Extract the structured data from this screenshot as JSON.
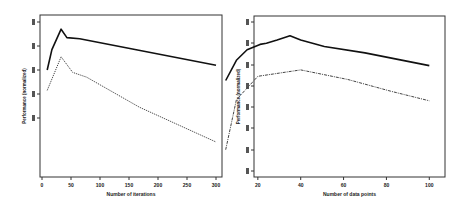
{
  "chart_data": [
    {
      "type": "line",
      "title": "",
      "xlabel": "Number of iterations",
      "ylabel": "Performance (normalized)",
      "xlim": [
        0,
        300
      ],
      "ylim": [
        0,
        4.3
      ],
      "x_ticks": [
        0,
        50,
        100,
        150,
        200,
        250,
        300
      ],
      "x_tick_labels": [
        "0",
        "50",
        "100",
        "150",
        "200",
        "250",
        "300"
      ],
      "y_ticks": [
        0,
        1,
        2,
        3,
        4
      ],
      "y_tick_labels": [
        "",
        "",
        "",
        "",
        ""
      ],
      "grid": false,
      "legend": null,
      "series": [
        {
          "name": "upper (solid)",
          "style": "solid",
          "x": [
            9,
            17,
            33,
            43,
            65,
            300
          ],
          "y": [
            2.0,
            2.85,
            3.7,
            3.35,
            3.3,
            2.2
          ]
        },
        {
          "name": "lower (dotted)",
          "style": "dotted",
          "x": [
            9,
            33,
            53,
            77,
            168,
            300
          ],
          "y": [
            1.15,
            2.55,
            1.9,
            1.7,
            0.45,
            -1.0
          ]
        }
      ]
    },
    {
      "type": "line",
      "title": "",
      "xlabel": "Number of data points",
      "ylabel": "Performance (normalized)",
      "xlim": [
        0,
        105
      ],
      "ylim": [
        0,
        7.5
      ],
      "x_ticks": [
        20,
        40,
        60,
        80,
        100
      ],
      "x_tick_labels": [
        "20",
        "40",
        "60",
        "80",
        "100"
      ],
      "y_ticks": [
        0,
        1,
        2,
        3,
        4,
        5,
        6,
        7
      ],
      "y_tick_labels": [
        "",
        "",
        "",
        "",
        "",
        "",
        "",
        ""
      ],
      "grid": false,
      "legend": null,
      "series": [
        {
          "name": "upper (solid)",
          "style": "solid",
          "x": [
            5,
            10,
            15,
            21,
            24,
            29,
            35,
            40,
            51,
            70,
            100
          ],
          "y": [
            4.25,
            5.2,
            5.7,
            5.95,
            6.0,
            6.15,
            6.35,
            6.15,
            5.85,
            5.55,
            4.95
          ]
        },
        {
          "name": "lower (dash-dot)",
          "style": "dashdot",
          "x": [
            5,
            10,
            20,
            40,
            62,
            82,
            100
          ],
          "y": [
            1.0,
            3.35,
            4.45,
            4.75,
            4.3,
            3.75,
            3.3
          ]
        }
      ]
    }
  ],
  "layout": {
    "panels": [
      {
        "frame": [
          40,
          15,
          222,
          177
        ],
        "x_px": [
          42,
          216
        ],
        "y_px": [
          118,
          22
        ],
        "y_tick_px": [
          118,
          94,
          70,
          46,
          22
        ]
      },
      {
        "frame": [
          254,
          16,
          445,
          177
        ],
        "x_px": [
          215,
          440
        ],
        "y_px": [
          171,
          22
        ],
        "y_tick_px": [
          171,
          150,
          128,
          107,
          86,
          65,
          43,
          22
        ]
      }
    ]
  }
}
